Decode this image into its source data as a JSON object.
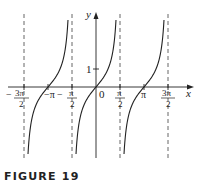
{
  "caption": "FIGURE 19",
  "chart_data": {
    "type": "line",
    "function": "y = tan x",
    "xlabel": "x",
    "ylabel": "y",
    "x_ticks": [
      {
        "value": -4.712,
        "label_num": "3π",
        "label_den": "2",
        "sign": "−"
      },
      {
        "value": -3.1416,
        "label": "−π"
      },
      {
        "value": -1.5708,
        "label_num": "π",
        "label_den": "2",
        "sign": "−"
      },
      {
        "value": 0,
        "label": "0"
      },
      {
        "value": 1.5708,
        "label_num": "π",
        "label_den": "2"
      },
      {
        "value": 3.1416,
        "label": "π"
      },
      {
        "value": 4.712,
        "label_num": "3π",
        "label_den": "2"
      }
    ],
    "y_ticks": [
      {
        "value": 1,
        "label": "1"
      }
    ],
    "asymptotes": [
      -4.712,
      -1.5708,
      1.5708,
      4.712
    ],
    "zeros": [
      -3.1416,
      0,
      3.1416
    ],
    "xlim": [
      -5.8,
      5.8
    ],
    "ylim": [
      -4,
      4.1
    ],
    "grid": false,
    "colors": {
      "curve": "#222222",
      "axis": "#222222",
      "asymptote": "#555555"
    }
  },
  "labels": {
    "y_axis": "y",
    "x_axis": "x",
    "origin": "0",
    "one": "1",
    "neg_three_pi_over_2_sign": "−",
    "neg_three_pi_over_2_num": "3π",
    "neg_three_pi_over_2_den": "2",
    "neg_pi": "−π",
    "neg_pi_over_2_sign": "−",
    "neg_pi_over_2_num": "π",
    "neg_pi_over_2_den": "2",
    "pi_over_2_num": "π",
    "pi_over_2_den": "2",
    "pi": "π",
    "three_pi_over_2_num": "3π",
    "three_pi_over_2_den": "2"
  }
}
